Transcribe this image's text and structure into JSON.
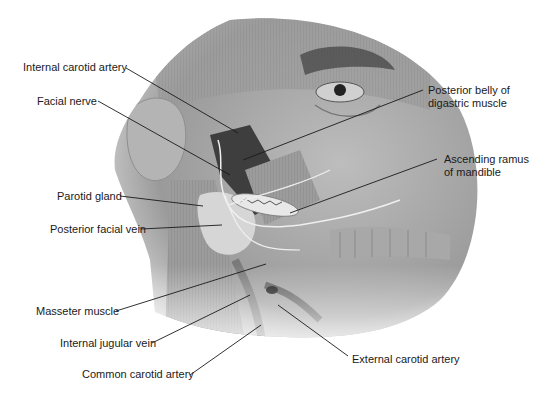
{
  "figure": {
    "type": "anatomical-illustration",
    "colors": {
      "background": "#ffffff",
      "line": "#1a1a1a",
      "text": "#1a1a1a",
      "tone_dark": "#3a3a3a",
      "tone_mid": "#8a8a8a",
      "tone_light": "#c8c8c8"
    }
  },
  "labels": {
    "internal_carotid_artery": "Internal carotid artery",
    "facial_nerve": "Facial nerve",
    "parotid_gland": "Parotid gland",
    "posterior_facial_vein": "Posterior facial vein",
    "masseter_muscle": "Masseter muscle",
    "internal_jugular_vein": "Internal jugular vein",
    "common_carotid_artery": "Common carotid artery",
    "posterior_belly_line1": "Posterior belly of",
    "posterior_belly_line2": "digastric muscle",
    "ascending_ramus_line1": "Ascending ramus",
    "ascending_ramus_line2": "of mandible",
    "external_carotid_artery": "External carotid artery"
  }
}
